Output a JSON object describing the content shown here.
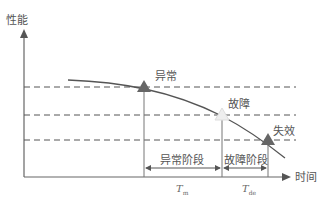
{
  "diagram": {
    "y_axis_label": "性能",
    "x_axis_label": "时间",
    "markers": [
      {
        "label": "异常",
        "fill": "#666666"
      },
      {
        "label": "故障",
        "fill": "#eeeeee"
      },
      {
        "label": "失效",
        "fill": "#666666"
      }
    ],
    "phases": [
      {
        "label": "异常阶段",
        "symbol": "T",
        "subscript": "m"
      },
      {
        "label": "故障阶段",
        "symbol": "T",
        "subscript": "de"
      }
    ],
    "threshold_lines": 3,
    "colors": {
      "line": "#666666",
      "dash": "#555555",
      "text": "#555555"
    }
  }
}
